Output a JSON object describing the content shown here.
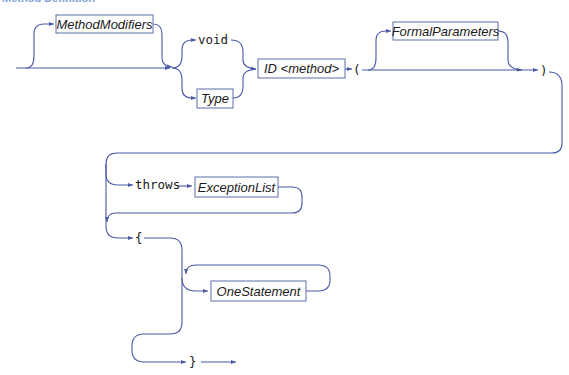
{
  "diagram": {
    "title": "Method Definition",
    "colors": {
      "line": "#4a5aa8",
      "box_border": "#5f6fae",
      "text": "#1a1a1a"
    },
    "nonterminals": {
      "method_modifiers": "MethodModifiers",
      "type": "Type",
      "id_method": "ID <method>",
      "formal_parameters": "FormalParameters",
      "exception_list": "ExceptionList",
      "one_statement": "OneStatement"
    },
    "terminals": {
      "void": "void",
      "open_paren": "(",
      "close_paren": ")",
      "throws": "throws",
      "open_brace": "{",
      "close_brace": "}"
    }
  }
}
